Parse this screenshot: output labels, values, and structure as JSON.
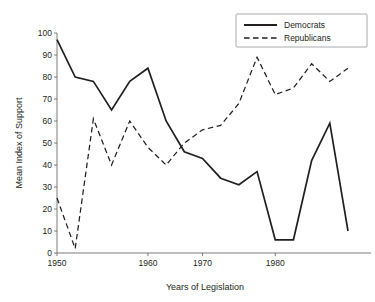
{
  "chart_data": {
    "type": "line",
    "title": "",
    "xlabel": "Years of Legislation",
    "ylabel": "Mean Index of Support",
    "xlim": [
      1950,
      1996
    ],
    "ylim": [
      0,
      100
    ],
    "grid": false,
    "legend_position": "top-right",
    "xticks": [
      1950,
      1960,
      1970,
      1980,
      1990
    ],
    "xtick_labels": [
      "1950",
      "1960",
      "1970",
      "1980",
      "1990"
    ],
    "yticks": [
      0,
      10,
      20,
      30,
      40,
      50,
      60,
      70,
      80,
      90,
      100
    ],
    "ytick_labels": [
      "0",
      "10",
      "20",
      "30",
      "40",
      "50",
      "60",
      "70",
      "80",
      "90",
      "100"
    ],
    "series": [
      {
        "name": "Democrats",
        "style": "solid",
        "color": "#231f20",
        "x": [
          1950,
          1952,
          1954,
          1956,
          1958,
          1960,
          1964,
          1968,
          1970,
          1972,
          1974,
          1976,
          1980,
          1984,
          1988,
          1992,
          1996
        ],
        "values": [
          97,
          80,
          78,
          65,
          78,
          84,
          60,
          46,
          43,
          34,
          31,
          37,
          6,
          6,
          42,
          59,
          10
        ]
      },
      {
        "name": "Republicans",
        "style": "dashed",
        "color": "#231f20",
        "x": [
          1950,
          1952,
          1954,
          1956,
          1958,
          1960,
          1964,
          1968,
          1970,
          1972,
          1974,
          1976,
          1980,
          1984,
          1988,
          1992,
          1996
        ],
        "values": [
          25,
          2,
          61,
          40,
          60,
          48,
          40,
          50,
          56,
          58,
          68,
          89,
          72,
          75,
          86,
          78,
          84
        ]
      }
    ]
  },
  "axes": {
    "x_axis_title": "Years of Legislation",
    "y_axis_title": "Mean Index of Support"
  },
  "legend": {
    "entries": [
      {
        "label": "Democrats",
        "style": "solid"
      },
      {
        "label": "Republicans",
        "style": "dashed"
      }
    ]
  }
}
